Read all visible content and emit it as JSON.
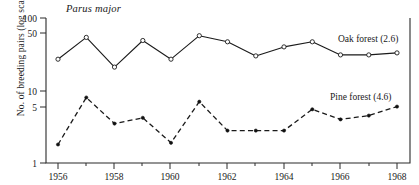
{
  "chart_data": {
    "type": "line",
    "title": "Parus major",
    "xlabel": "",
    "ylabel": "No. of breeding pairs (log scale)",
    "log_y": true,
    "ylim": [
      1,
      100
    ],
    "xlim": [
      1956,
      1968
    ],
    "grid": false,
    "legend_position": "inline-right",
    "y_ticks": [
      1,
      5,
      10,
      50,
      100
    ],
    "y_tick_labels": [
      "1",
      "5",
      "10",
      "50",
      "100"
    ],
    "x_ticks": [
      1956,
      1957,
      1958,
      1959,
      1960,
      1961,
      1962,
      1963,
      1964,
      1965,
      1966,
      1967,
      1968
    ],
    "x_tick_labels": [
      "1956",
      "",
      "1958",
      "",
      "1960",
      "",
      "1962",
      "",
      "1964",
      "",
      "1966",
      "",
      "1968"
    ],
    "x": [
      1956,
      1957,
      1958,
      1959,
      1960,
      1961,
      1962,
      1963,
      1964,
      1965,
      1966,
      1967,
      1968
    ],
    "series": [
      {
        "name": "Oak forest (2.6)",
        "marker": "open-circle",
        "linestyle": "solid",
        "values": [
          27,
          54,
          21,
          49,
          27,
          57,
          47,
          30,
          40,
          47,
          31,
          31,
          33
        ]
      },
      {
        "name": "Pine forest (4.6)",
        "marker": "filled-dot",
        "linestyle": "dashed",
        "values": [
          1.8,
          8.0,
          3.5,
          4.2,
          1.9,
          7.0,
          2.8,
          2.8,
          2.8,
          5.5,
          4.0,
          4.5,
          6.0
        ]
      }
    ],
    "annotations": [
      {
        "text": "Oak forest (2.6)",
        "x": 1967.0,
        "y": 72
      },
      {
        "text": "Pine forest (4.6)",
        "x": 1967.1,
        "y": 9.5
      }
    ]
  }
}
